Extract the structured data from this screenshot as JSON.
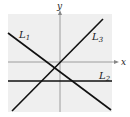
{
  "diagram": {
    "axes": {
      "x_label": "x",
      "y_label": "y"
    },
    "lines": [
      {
        "name": "L",
        "subscript": "1",
        "description": "negative slope"
      },
      {
        "name": "L",
        "subscript": "2",
        "description": "horizontal, below x-axis"
      },
      {
        "name": "L",
        "subscript": "3",
        "description": "positive slope"
      }
    ],
    "colors": {
      "background": "#efefef",
      "line": "#111111",
      "axis": "#777777"
    }
  }
}
